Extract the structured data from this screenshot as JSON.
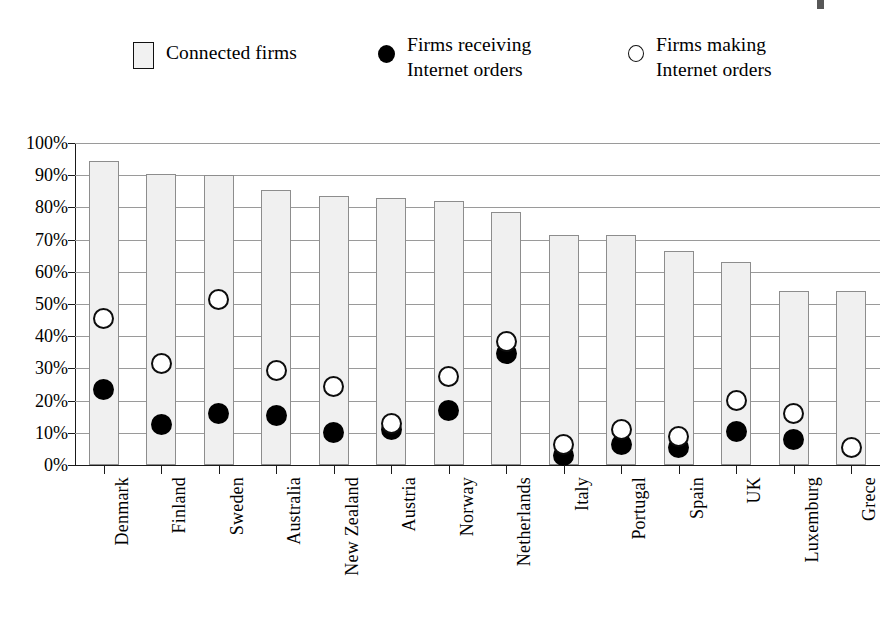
{
  "legend": {
    "items": [
      {
        "label": "Connected firms",
        "marker": "square-swatch"
      },
      {
        "label": "Firms receiving\nInternet orders",
        "marker": "filled-circle-swatch"
      },
      {
        "label": "Firms making\nInternet orders",
        "marker": "hollow-circle-swatch"
      }
    ]
  },
  "chart_data": {
    "type": "bar",
    "title": "",
    "subtitle": "",
    "xlabel": "",
    "ylabel": "",
    "ylim": [
      0,
      100
    ],
    "grid": true,
    "legend_position": "top",
    "categories": [
      "Denmark",
      "Finland",
      "Sweden",
      "Australia",
      "New Zealand",
      "Austria",
      "Norway",
      "Netherlands",
      "Italy",
      "Portugal",
      "Spain",
      "UK",
      "Luxemburg",
      "Grece"
    ],
    "ytick_labels": [
      "100%",
      "90%",
      "80%",
      "70%",
      "60%",
      "50%",
      "40%",
      "30%",
      "20%",
      "10%",
      "0%"
    ],
    "ytick_values": [
      100,
      90,
      80,
      70,
      60,
      50,
      40,
      30,
      20,
      10,
      0
    ],
    "series": [
      {
        "name": "Connected firms",
        "marker": "bar",
        "values": [
          94.5,
          90.5,
          90,
          85.5,
          83.5,
          83,
          82,
          78.5,
          71.5,
          71.5,
          66.5,
          63,
          54,
          54
        ]
      },
      {
        "name": "Firms making Internet orders",
        "marker": "hollow-circle",
        "values": [
          45.5,
          31.5,
          51.5,
          29.5,
          24.5,
          13,
          27.5,
          38.5,
          6.5,
          11,
          9,
          20,
          16,
          5.5
        ]
      },
      {
        "name": "Firms receiving Internet orders",
        "marker": "filled-circle",
        "values": [
          23.5,
          12.5,
          16,
          15.5,
          10,
          11,
          17,
          34.5,
          3,
          6.5,
          5.5,
          10.5,
          8,
          null
        ]
      }
    ]
  }
}
